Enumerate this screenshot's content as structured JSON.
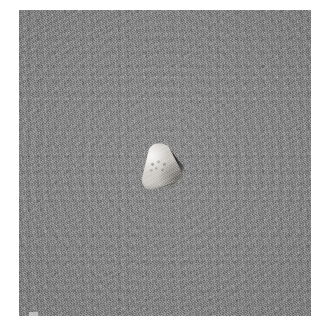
{
  "image": {
    "kind": "natural-photograph",
    "description": "Close-up photograph of a single small pale triangular object resting on a flat gray granular surface",
    "width_px": 329,
    "height_px": 327,
    "orientation": "square-crop",
    "color_mode": "grayscale",
    "margin": {
      "color": "#ffffff",
      "left_px": 19,
      "top_px": 10,
      "right_px": 18,
      "bottom_px": 11
    }
  },
  "background": {
    "name": "gray-granular-substrate",
    "base_color": "#878787",
    "texture": "fine granular noise with faint concentric brush rings",
    "shape": "square slab filling the frame",
    "bounds_px": {
      "x": 19,
      "y": 10,
      "width": 292,
      "height": 306
    },
    "edge_nick": {
      "name": "pale-notch-lower-left-edge",
      "color": "#c9c9c9",
      "x_px": 29,
      "y_px": 311
    }
  },
  "subject": {
    "name": "triangular-specimen",
    "label": "small pale rounded-triangular object",
    "shape": "rounded triangle, apex pointing up, tilted slightly counter-clockwise",
    "surface": "matte, lightly pitted with small darker speckles near the center face",
    "highlight_color": "#e3e1dd",
    "midtone_color": "#cbc8c2",
    "shadow_color": "#9a9791",
    "bounds_px": {
      "x": 138,
      "y": 143,
      "width": 44,
      "height": 46
    },
    "center_px": {
      "x": 159,
      "y": 166
    },
    "vertices_px": [
      {
        "name": "apex-top",
        "x": 158,
        "y": 144
      },
      {
        "name": "vertex-lower-right",
        "x": 177,
        "y": 177
      },
      {
        "name": "vertex-lower-left",
        "x": 139,
        "y": 187
      }
    ]
  },
  "cast_shadow": {
    "name": "cast-shadow-crescent",
    "color": "#191919",
    "direction": "lower-right",
    "description": "dark crescent shadow hugging the right and lower-right flank of the specimen",
    "bounds_px": {
      "x": 160,
      "y": 150,
      "width": 26,
      "height": 42
    }
  },
  "lighting": {
    "key_light_direction": "upper-left",
    "shadow_direction": "lower-right",
    "contrast": "moderate"
  }
}
